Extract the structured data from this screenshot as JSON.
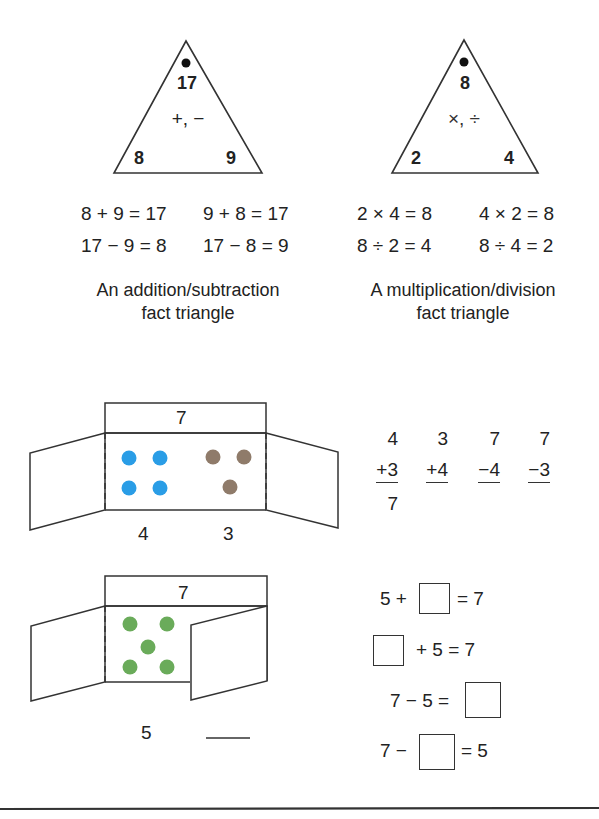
{
  "triangles": [
    {
      "id": "addition-subtraction",
      "top": "17",
      "left": "8",
      "right": "9",
      "operators": "+, −",
      "facts": [
        "8 + 9 = 17",
        "9 + 8 = 17",
        "17 − 9 = 8",
        "17 − 8 = 9"
      ],
      "caption_line1": "An addition/subtraction",
      "caption_line2": "fact triangle"
    },
    {
      "id": "multiplication-division",
      "top": "8",
      "left": "2",
      "right": "4",
      "operators": "×, ÷",
      "facts": [
        "2 × 4 = 8",
        "4 × 2 = 8",
        "8 ÷ 2 = 4",
        "8 ÷ 4 = 2"
      ],
      "caption_line1": "A multiplication/division",
      "caption_line2": "fact triangle"
    }
  ],
  "folding_box_1": {
    "total": "7",
    "left_count": "4",
    "right_count": "3",
    "dot_colors": {
      "left": "#2a9de6",
      "right": "#8f7b6a"
    }
  },
  "column_problems": [
    {
      "top": "4",
      "bottom": "+3",
      "answer": "7"
    },
    {
      "top": "3",
      "bottom": "+4",
      "answer": ""
    },
    {
      "top": "7",
      "bottom": "−4",
      "answer": ""
    },
    {
      "top": "7",
      "bottom": "−3",
      "answer": ""
    }
  ],
  "folding_box_2": {
    "total": "7",
    "visible_count": "5",
    "hidden_count": "",
    "dot_color": "#6aab5a"
  },
  "missing_number_equations": [
    {
      "before": "5 +",
      "after": "= 7"
    },
    {
      "before": "",
      "after": "+ 5 = 7"
    },
    {
      "before": "7 − 5 =",
      "after": ""
    },
    {
      "before": "7 −",
      "after": "= 5"
    }
  ]
}
